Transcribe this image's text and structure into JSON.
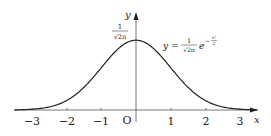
{
  "diagram": {
    "curve_formula": "y = (1/√(2π)) e^(−x²/2)",
    "labels": {
      "y_axis": "y",
      "x_axis": "x",
      "origin": "O",
      "peak_numerator": "1",
      "peak_denominator": "√2π",
      "formula_lhs": "y =",
      "formula_num": "1",
      "formula_den": "√2π",
      "formula_base": "e",
      "formula_exp": "−",
      "formula_exp_num": "x²",
      "formula_exp_den": "2"
    },
    "x_ticks": [
      "−3",
      "−2",
      "−1",
      "1",
      "2",
      "3"
    ],
    "colors": {
      "curve": "#222222",
      "axis": "#555555"
    }
  },
  "chart_data": {
    "type": "line",
    "title": "",
    "xlabel": "x",
    "ylabel": "y",
    "xlim": [
      -3.5,
      3.5
    ],
    "ylim": [
      0,
      0.45
    ],
    "x": [
      -3.5,
      -3,
      -2.5,
      -2,
      -1.5,
      -1,
      -0.5,
      0,
      0.5,
      1,
      1.5,
      2,
      2.5,
      3,
      3.5
    ],
    "series": [
      {
        "name": "y = 1/√(2π) e^(−x²/2)",
        "values": [
          0.0009,
          0.0044,
          0.0175,
          0.054,
          0.1295,
          0.242,
          0.3521,
          0.3989,
          0.3521,
          0.242,
          0.1295,
          0.054,
          0.0175,
          0.0044,
          0.0009
        ]
      }
    ],
    "annotations": [
      "1/√(2π) at peak",
      "O origin"
    ],
    "grid": false
  }
}
